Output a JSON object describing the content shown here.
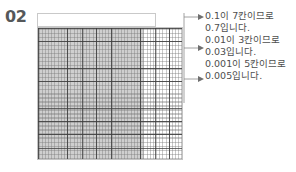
{
  "problem": {
    "number": "02"
  },
  "figure": {
    "name": "decimal-hundredths-grid",
    "model": "10x10 grid subdivided into thousandths",
    "value_shown": "0.735",
    "shaded": {
      "tenths_columns": 7,
      "hundredths_columns": 3,
      "thousandths_cells": 5
    },
    "colors": {
      "shade_fill": "#cfcfcf",
      "shade_fill_light": "#d6d6d6",
      "grid_line_fine": "#787878",
      "grid_line_major": "#3c3c3c",
      "frame": "#c4c4c4"
    }
  },
  "explanations": [
    {
      "icon": "arrow-right-icon",
      "line1": "0.1이 7칸이므로",
      "line2": "0.7입니다."
    },
    {
      "icon": "arrow-right-icon",
      "line1": "0.01이 3칸이므로",
      "line2": "0.03입니다."
    },
    {
      "icon": "arrow-right-icon",
      "line1": "0.001이 5칸이므로",
      "line2": "0.005입니다."
    }
  ]
}
